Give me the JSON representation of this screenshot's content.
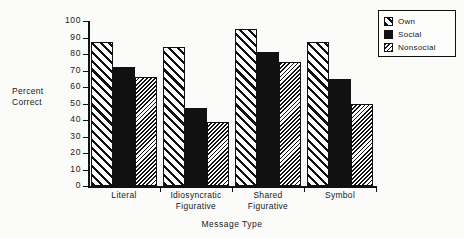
{
  "chart_data": {
    "type": "bar",
    "title": "",
    "xlabel": "Message Type",
    "ylabel": "Percent Correct",
    "ylabel_lines": [
      "Percent",
      "Correct"
    ],
    "categories": [
      "Literal",
      "Idiosyncratic Figurative",
      "Shared Figurative",
      "Symbol"
    ],
    "category_lines": [
      [
        "Literal"
      ],
      [
        "Idiosyncratic",
        "Figurative"
      ],
      [
        "Shared",
        "Figurative"
      ],
      [
        "Symbol"
      ]
    ],
    "series": [
      {
        "name": "Own",
        "pattern": "diagonal-hatch",
        "values": [
          87,
          84,
          95,
          87
        ]
      },
      {
        "name": "Social",
        "pattern": "solid-black",
        "values": [
          72,
          47,
          81,
          65
        ]
      },
      {
        "name": "Nonsocial",
        "pattern": "dense-hatch",
        "values": [
          66,
          39,
          75,
          50
        ]
      }
    ],
    "ylim": [
      0,
      100
    ],
    "ytick_step": 10,
    "yticks": [
      0,
      10,
      20,
      30,
      40,
      50,
      60,
      70,
      80,
      90,
      100
    ],
    "ytick_labels": [
      "0",
      "10",
      "20",
      "30",
      "40",
      "50",
      "60",
      "70",
      "80",
      "90",
      "100"
    ],
    "grid": false,
    "legend_position": "top-right"
  },
  "legend": {
    "entries": [
      {
        "label": "Own"
      },
      {
        "label": "Social"
      },
      {
        "label": "Nonsocial"
      }
    ]
  },
  "colors": {
    "ink": "#111111",
    "paper": "#fbfbfa",
    "series_social": "#111111"
  }
}
